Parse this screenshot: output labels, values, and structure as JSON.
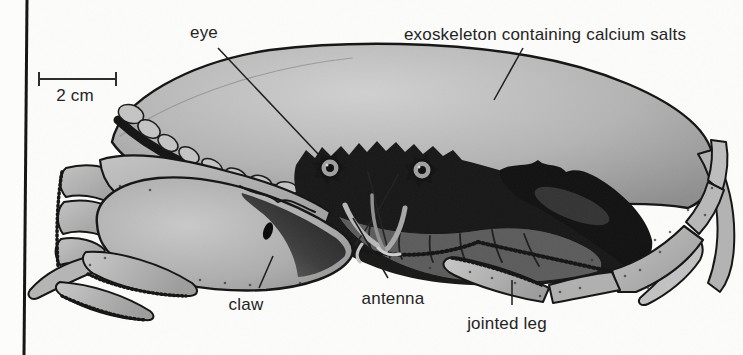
{
  "figure": {
    "type": "labelled-biology-diagram",
    "scale_bar": {
      "label": "2 cm"
    },
    "labels": {
      "eye": "eye",
      "exoskeleton": "exoskeleton containing calcium salts",
      "claw": "claw",
      "antenna": "antenna",
      "jointed_leg": "jointed leg"
    },
    "colors": {
      "background": "#fcfcfa",
      "ink": "#1a1a1a",
      "label_text": "#242424",
      "carapace_light": "#cecece",
      "carapace_dark": "#909090",
      "shadow_dark": "#141414",
      "underbody_gray": "#5c5c5c"
    }
  }
}
